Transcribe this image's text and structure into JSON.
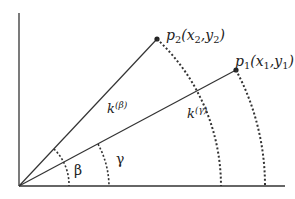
{
  "diagram": {
    "type": "vector angle diagram",
    "colors": {
      "line": "#333333",
      "background": "#ffffff"
    },
    "origin": {
      "x": 19,
      "y": 186
    },
    "axes": {
      "y_axis": {
        "top": 13
      },
      "x_axis": {
        "right": 285
      }
    },
    "points": [
      {
        "id": "p2",
        "name": "p",
        "sub": "2",
        "coords_label": "(x",
        "coords_sub1": "2",
        "comma": ",y",
        "coords_sub2": "2",
        "close": ")",
        "x": 157,
        "y": 39
      },
      {
        "id": "p1",
        "name": "p",
        "sub": "1",
        "coords_label": "(x",
        "coords_sub1": "1",
        "comma": ",y",
        "coords_sub2": "1",
        "close": ")",
        "x": 236,
        "y": 70
      }
    ],
    "vector_labels": [
      {
        "id": "k-beta",
        "base": "k",
        "sup": "(β)"
      },
      {
        "id": "k-gamma",
        "base": "k",
        "sup": "(γ)"
      }
    ],
    "angles": [
      {
        "id": "beta",
        "symbol": "β"
      },
      {
        "id": "gamma",
        "symbol": "γ"
      }
    ]
  }
}
